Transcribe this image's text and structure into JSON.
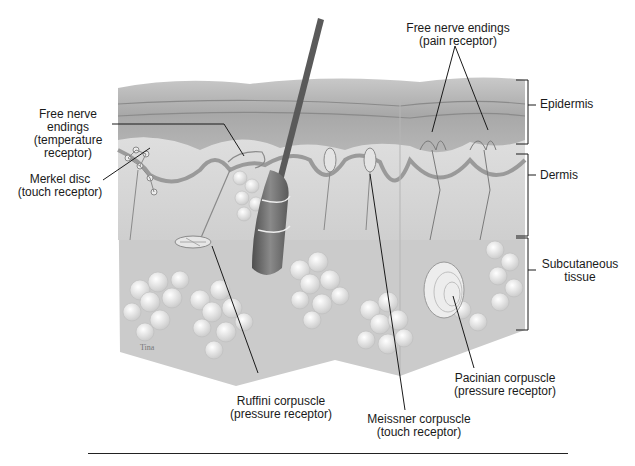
{
  "figure": {
    "layers": [
      {
        "id": "epidermis",
        "label": "Epidermis",
        "bracket": {
          "x": 528,
          "y1": 80,
          "y2": 144
        },
        "label_pos": {
          "x": 553,
          "y": 105
        }
      },
      {
        "id": "dermis",
        "label": "Dermis",
        "bracket": {
          "x": 528,
          "y1": 154,
          "y2": 236
        },
        "label_pos": {
          "x": 538,
          "y": 175
        }
      },
      {
        "id": "subcutaneous",
        "label": "Subcutaneous\ntissue",
        "bracket": {
          "x": 528,
          "y1": 238,
          "y2": 330
        },
        "label_pos": {
          "x": 538,
          "y": 265
        }
      }
    ],
    "receptors": [
      {
        "id": "free-nerve-endings-pain",
        "label": "Free nerve endings\n(pain receptor)",
        "label_pos": {
          "x": 455,
          "y": 22
        },
        "align": "center"
      },
      {
        "id": "free-nerve-endings-temperature",
        "label": "Free nerve\nendings\n(temperature\nreceptor)",
        "label_pos": {
          "x": 38,
          "y": 110
        },
        "align": "center"
      },
      {
        "id": "merkel-disc",
        "label": "Merkel disc\n(touch receptor)",
        "label_pos": {
          "x": 28,
          "y": 170
        },
        "align": "center"
      },
      {
        "id": "ruffini-corpuscle",
        "label": "Ruffini corpuscle\n(pressure receptor)",
        "label_pos": {
          "x": 222,
          "y": 396
        },
        "align": "center"
      },
      {
        "id": "meissner-corpuscle",
        "label": "Meissner corpuscle\n(touch receptor)",
        "label_pos": {
          "x": 357,
          "y": 414
        },
        "align": "center"
      },
      {
        "id": "pacinian-corpuscle",
        "label": "Pacinian corpuscle\n(pressure receptor)",
        "label_pos": {
          "x": 447,
          "y": 372
        },
        "align": "center"
      }
    ],
    "colors": {
      "epidermis": "#b8b8b8",
      "epidermis_dark": "#8e8e8e",
      "dermis": "#dcdcdc",
      "subcutaneous": "#cfcfcf",
      "fat": "#f2f2f2",
      "hair": "#6e6e6e",
      "line": "#1a1a1a"
    },
    "signature": "Tina"
  }
}
